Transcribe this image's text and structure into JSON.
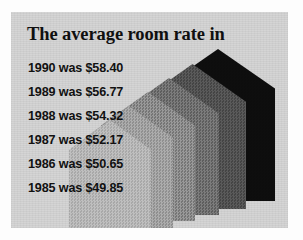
{
  "figure": {
    "title": "The average room rate in",
    "panel_color": "#d3d3d3",
    "page_color": "#fdfdfd"
  },
  "rows": [
    {
      "year": "1990",
      "verb": " was ",
      "amount": "$58.40",
      "line": "1990 was $58.40"
    },
    {
      "year": "1989",
      "verb": " was ",
      "amount": "$56.77",
      "line": "1989 was $56.77"
    },
    {
      "year": "1988",
      "verb": " was ",
      "amount": "$54.32",
      "line": "1988 was $54.32"
    },
    {
      "year": "1987",
      "verb": " was ",
      "amount": "$52.17",
      "line": "1987 was $52.17"
    },
    {
      "year": "1986",
      "verb": " was ",
      "amount": "$50.65",
      "line": "1986 was $50.65"
    },
    {
      "year": "1985",
      "verb": " was ",
      "amount": "$49.85",
      "line": "1985 was $49.85"
    }
  ],
  "chart_data": {
    "type": "bar",
    "title": "The average room rate in",
    "subtitle": "",
    "xlabel": "",
    "ylabel": "Average room rate (USD)",
    "categories": [
      "1985",
      "1986",
      "1987",
      "1988",
      "1989",
      "1990"
    ],
    "values": [
      49.85,
      50.65,
      52.17,
      54.32,
      56.77,
      58.4
    ],
    "value_labels": [
      "$49.85",
      "$50.65",
      "$52.17",
      "$54.32",
      "$56.77",
      "$58.40"
    ],
    "ylim": [
      0,
      60
    ],
    "grid": false,
    "legend": false,
    "legend_position": "none",
    "annotations": [
      "1990 was $58.40",
      "1989 was $56.77",
      "1988 was $54.32",
      "1987 was $52.17",
      "1986 was $50.65",
      "1985 was $49.85"
    ]
  },
  "houses": [
    {
      "name": "house-1990",
      "year": "1990",
      "amount": "$58.40",
      "color": "#0d0d0d",
      "left": 150,
      "top": 37,
      "width": 114,
      "height": 152,
      "z": 1
    },
    {
      "name": "house-1989",
      "year": "1989",
      "amount": "$56.77",
      "color": "#4d4d4d",
      "left": 128,
      "top": 52,
      "width": 107,
      "height": 145,
      "z": 2
    },
    {
      "name": "house-1988",
      "year": "1988",
      "amount": "$54.32",
      "color": "#6a6a6a",
      "left": 108,
      "top": 66,
      "width": 100,
      "height": 137,
      "z": 3
    },
    {
      "name": "house-1987",
      "year": "1987",
      "amount": "$52.17",
      "color": "#848484",
      "left": 90,
      "top": 80,
      "width": 94,
      "height": 129,
      "z": 4
    },
    {
      "name": "house-1986",
      "year": "1986",
      "amount": "$50.65",
      "color": "#9b9b9b",
      "left": 74,
      "top": 94,
      "width": 88,
      "height": 122,
      "z": 5
    },
    {
      "name": "house-1985",
      "year": "1985",
      "amount": "$49.85",
      "color": "#b2b2b2",
      "left": 58,
      "top": 108,
      "width": 82,
      "height": 114,
      "z": 6
    }
  ]
}
